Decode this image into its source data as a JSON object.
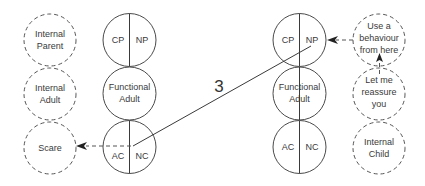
{
  "diagram": {
    "type": "transactional-analysis-ego-states",
    "colors": {
      "stroke": "#4a4a4a",
      "text": "#3a3a3a",
      "background": "#ffffff"
    },
    "left_internal_states": [
      {
        "id": "internal-parent",
        "lines": [
          "Internal",
          "Parent"
        ]
      },
      {
        "id": "internal-adult",
        "lines": [
          "Internal",
          "Adult"
        ]
      },
      {
        "id": "scare",
        "lines": [
          "Scare"
        ]
      }
    ],
    "left_person": {
      "parent": {
        "left": "CP",
        "right": "NP"
      },
      "adult": {
        "lines": [
          "Functional",
          "Adult"
        ]
      },
      "child": {
        "left": "AC",
        "right": "NC"
      }
    },
    "right_person": {
      "parent": {
        "left": "CP",
        "right": "NP"
      },
      "adult": {
        "lines": [
          "Functional",
          "Adult"
        ]
      },
      "child": {
        "left": "AC",
        "right": "NC"
      }
    },
    "right_internal_states": [
      {
        "id": "use-behaviour",
        "lines": [
          "Use a",
          "behaviour",
          "from here"
        ]
      },
      {
        "id": "reassure",
        "lines": [
          "Let me",
          "reassure",
          "you"
        ]
      },
      {
        "id": "internal-child",
        "lines": [
          "Internal",
          "Child"
        ]
      }
    ],
    "transaction": {
      "label": "3",
      "from": "left-NC",
      "to": "right-NP"
    },
    "arrows": [
      {
        "from": "left-child",
        "to": "scare",
        "style": "dashed"
      },
      {
        "from": "use-behaviour",
        "to": "right-NP",
        "style": "dashed"
      },
      {
        "from": "reassure",
        "to": "use-behaviour",
        "style": "dashed"
      }
    ]
  }
}
